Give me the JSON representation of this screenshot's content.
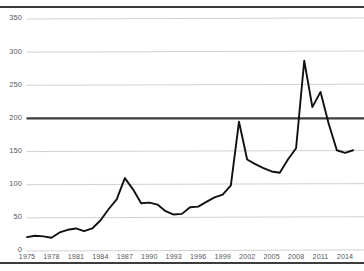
{
  "chart_data": {
    "type": "line",
    "title": "",
    "subtitle": "",
    "xlabel": "",
    "ylabel": "",
    "grid": true,
    "legend": "none",
    "xlim": [
      1975,
      2015
    ],
    "ylim": [
      0,
      360
    ],
    "y_ticks": [
      0,
      50,
      100,
      150,
      200,
      250,
      300,
      350
    ],
    "y_tick_labels": [
      "0",
      "50",
      "100",
      "150",
      "200",
      "250",
      "300",
      "350"
    ],
    "x_ticks": [
      1975,
      1978,
      1981,
      1984,
      1987,
      1990,
      1993,
      1996,
      1999,
      2002,
      2005,
      2008,
      2011,
      2014
    ],
    "x_tick_labels": [
      "1975",
      "1978",
      "1981",
      "1984",
      "1987",
      "1990",
      "1993",
      "1996",
      "1999",
      "2002",
      "2005",
      "2008",
      "2011",
      "2014"
    ],
    "emphasized_gridline": 200,
    "series": [
      {
        "name": "series-1",
        "color": "#111111",
        "x": [
          1975,
          1976,
          1977,
          1978,
          1979,
          1980,
          1981,
          1982,
          1983,
          1984,
          1985,
          1986,
          1987,
          1988,
          1989,
          1990,
          1991,
          1992,
          1993,
          1994,
          1995,
          1996,
          1997,
          1998,
          1999,
          2000,
          2001,
          2002,
          2003,
          2004,
          2005,
          2006,
          2007,
          2008,
          2009,
          2010,
          2011,
          2012,
          2013,
          2014,
          2015
        ],
        "values": [
          21,
          23,
          22,
          20,
          28,
          32,
          34,
          30,
          34,
          46,
          63,
          78,
          110,
          93,
          72,
          73,
          70,
          60,
          55,
          56,
          66,
          67,
          74,
          81,
          85,
          99,
          195,
          138,
          131,
          125,
          120,
          118,
          138,
          155,
          287,
          217,
          240,
          192,
          152,
          148,
          152
        ]
      }
    ]
  },
  "axes": {
    "y_label_color": "#55585c",
    "x_label_color": "#55585c",
    "gridline_color": "#c9c9c9",
    "emphasis_color": "#3c3c3c"
  },
  "rules": {
    "top": "horizontal-rule-top",
    "bottom": "horizontal-rule-bottom"
  }
}
